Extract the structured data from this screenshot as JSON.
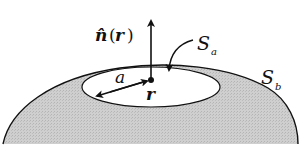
{
  "diagram": {
    "labels": {
      "normal_hat": "n̂",
      "normal_open": "(",
      "normal_r": "r",
      "normal_close": ")",
      "surface_a_S": "S",
      "surface_a_sub": "a",
      "surface_b_S": "S",
      "surface_b_sub": "b",
      "radius": "a",
      "point": "r"
    },
    "colors": {
      "surface_fill": "#c8c8c8",
      "stroke": "#111111",
      "disk_fill": "#ffffff"
    }
  }
}
